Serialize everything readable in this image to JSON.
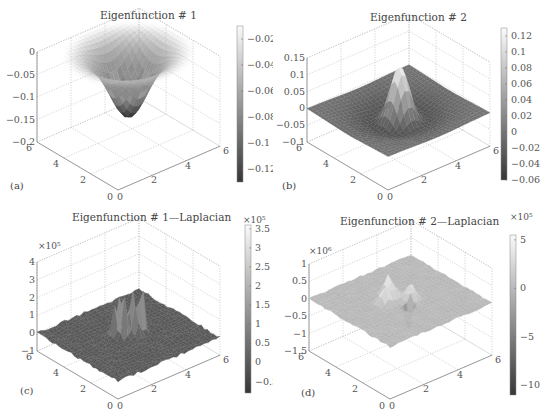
{
  "chart_data": [
    {
      "panel_label": "(a)",
      "type": "surface3d",
      "title": "Eigenfunction # 1",
      "x_ticks": [
        "0",
        "2",
        "4",
        "6"
      ],
      "y_ticks": [
        "0",
        "2",
        "4",
        "6"
      ],
      "z_ticks": [
        "0",
        "-0.05",
        "-0.1",
        "-0.15",
        "-0.2"
      ],
      "zlim": [
        -0.2,
        0
      ],
      "z_multiplier": "",
      "colorbar": {
        "ticks": [
          "-0.02",
          "-0.04",
          "-0.06",
          "-0.08",
          "-0.1",
          "-0.12"
        ],
        "range": [
          -0.13,
          -0.01
        ],
        "multiplier": ""
      },
      "shape": "bowl (single negative well, min about -0.14 at center)"
    },
    {
      "panel_label": "(b)",
      "type": "surface3d",
      "title": "Eigenfunction # 2",
      "x_ticks": [
        "0",
        "2",
        "4",
        "6"
      ],
      "y_ticks": [
        "0",
        "2",
        "4",
        "6"
      ],
      "z_ticks": [
        "0.15",
        "0.1",
        "0.05",
        "0",
        "-0.05",
        "-0.1"
      ],
      "zlim": [
        -0.1,
        0.15
      ],
      "z_multiplier": "",
      "colorbar": {
        "ticks": [
          "0.12",
          "0.1",
          "0.08",
          "0.06",
          "0.04",
          "0.02",
          "0",
          "-0.02",
          "-0.04",
          "-0.06"
        ],
        "range": [
          -0.06,
          0.13
        ],
        "multiplier": ""
      },
      "shape": "central peak ~0.12 with surrounding shallow negative basin"
    },
    {
      "panel_label": "(c)",
      "type": "surface3d",
      "title": "Eigenfunction # 1—Laplacian",
      "x_ticks": [
        "0",
        "2",
        "4",
        "6"
      ],
      "y_ticks": [
        "0",
        "2",
        "4",
        "6"
      ],
      "z_ticks": [
        "4",
        "3",
        "2",
        "1",
        "0",
        "-1"
      ],
      "zlim": [
        -1,
        4
      ],
      "z_multiplier": "×10⁵",
      "colorbar": {
        "ticks": [
          "3.5",
          "3",
          "2.5",
          "2",
          "1.5",
          "1",
          "0.5",
          "0",
          "-0.5"
        ],
        "range": [
          -0.8,
          3.6
        ],
        "multiplier": "×10⁵"
      },
      "shape": "noisy flat plane with cluster of sharp spikes up to ~3.3e5 near center"
    },
    {
      "panel_label": "(d)",
      "type": "surface3d",
      "title": "Eigenfunction # 2—Laplacian",
      "x_ticks": [
        "0",
        "2",
        "4",
        "6"
      ],
      "y_ticks": [
        "0",
        "2",
        "4",
        "6"
      ],
      "z_ticks": [
        "1",
        "0.5",
        "0",
        "-0.5",
        "-1",
        "-1.5"
      ],
      "zlim": [
        -1.5,
        1
      ],
      "z_multiplier": "×10⁶",
      "colorbar": {
        "ticks": [
          "5",
          "0",
          "-5",
          "-10"
        ],
        "range": [
          -11,
          5.5
        ],
        "multiplier": "×10⁵"
      },
      "shape": "noisy flat plane with several bumps up to ~5e5 and a dip to ~-1.1e6"
    }
  ]
}
